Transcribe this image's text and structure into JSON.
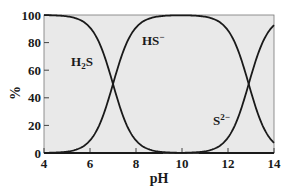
{
  "chart_data": {
    "type": "line",
    "title": "",
    "xlabel": "pH",
    "ylabel": "%",
    "xlim": [
      4,
      14
    ],
    "ylim": [
      0,
      100
    ],
    "x_ticks": [
      4,
      6,
      8,
      10,
      12,
      14
    ],
    "y_ticks": [
      0,
      20,
      40,
      60,
      80,
      100
    ],
    "grid": false,
    "legend": "inline labels",
    "pKa": [
      7.0,
      12.9
    ],
    "x": [
      4,
      5,
      5.5,
      6,
      6.5,
      7,
      7.5,
      8,
      8.5,
      9,
      10,
      11,
      11.5,
      12,
      12.5,
      12.9,
      13.5,
      14
    ],
    "series": [
      {
        "name": "H2S",
        "label": "H₂S",
        "values": [
          99.9,
          99.0,
          96.9,
          90.9,
          76.0,
          50.0,
          24.0,
          9.1,
          3.1,
          1.0,
          0.1,
          0.0,
          0.0,
          0.0,
          0.0,
          0.0,
          0.0,
          0.0
        ]
      },
      {
        "name": "HS-",
        "label": "HS⁻",
        "values": [
          0.1,
          1.0,
          3.1,
          9.1,
          24.0,
          50.0,
          76.0,
          90.9,
          96.9,
          99.0,
          99.8,
          98.7,
          96.2,
          88.8,
          71.5,
          50.0,
          20.1,
          7.4
        ]
      },
      {
        "name": "S2-",
        "label": "S²⁻",
        "values": [
          0.0,
          0.0,
          0.0,
          0.0,
          0.0,
          0.0,
          0.0,
          0.0,
          0.0,
          0.0,
          0.1,
          1.3,
          3.8,
          11.2,
          28.5,
          50.0,
          79.9,
          92.6
        ]
      }
    ]
  },
  "labels": {
    "xlabel": "pH",
    "ylabel": "%",
    "h2s_main": "H",
    "h2s_sub": "2",
    "h2s_tail": "S",
    "hs_main": "HS",
    "hs_sup": "−",
    "s_main": "S",
    "s_sup": "2−"
  },
  "colors": {
    "plot_background": "#e9e9e9",
    "line": "#1a1a1a",
    "axis": "#333333"
  }
}
